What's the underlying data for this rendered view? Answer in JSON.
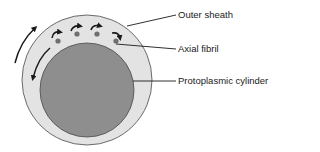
{
  "diagram": {
    "colors": {
      "outer_sheath_fill": "#e3e3e3",
      "outer_sheath_stroke": "#6a6a6a",
      "cylinder_fill": "#8e8e8e",
      "cylinder_stroke": "#4a4a4a",
      "fibril_fill": "#6f6f6f",
      "arrow_color": "#1a1a1a",
      "leader_line": "#1a1a1a",
      "text": "#1a1a1a"
    },
    "labels": [
      {
        "id": "outer-sheath",
        "text": "Outer sheath"
      },
      {
        "id": "axial-fibril",
        "text": "Axial fibril"
      },
      {
        "id": "protoplasmic-cylinder",
        "text": "Protoplasmic cylinder"
      }
    ],
    "axial_fibril_count": 4,
    "rotation_arrows": {
      "outer_counterclockwise_count": 1,
      "inner_clockwise_count": 1,
      "fibril_curl_arrows_count": 4
    }
  }
}
